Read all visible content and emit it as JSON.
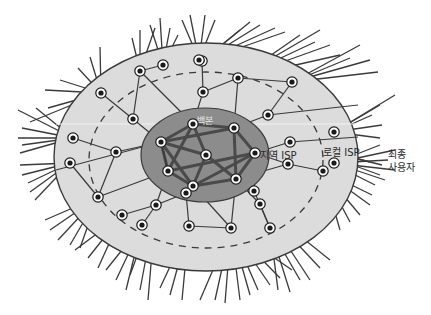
{
  "diagram": {
    "type": "internet-hierarchy",
    "labels": {
      "backbone": "백본",
      "regional_isp": "지역 ISP",
      "local_isp": "로컬 ISP",
      "end_user_line1": "최종",
      "end_user_line2": "사용자"
    },
    "colors": {
      "outer_region": "#dcdcdc",
      "core_region": "#8c8c8c",
      "line": "#3a3a3a",
      "backbone_link": "#4a4a4a",
      "node_fill": "#ffffff",
      "node_dot": "#1a1a1a"
    },
    "regions": {
      "outer": {
        "cx": 206,
        "cy": 157,
        "rx": 152,
        "ry": 114
      },
      "boundary_dashed": {
        "cx": 206,
        "cy": 160,
        "rx": 115,
        "ry": 87
      },
      "core": {
        "cx": 206,
        "cy": 155,
        "rx": 62,
        "ry": 45
      }
    },
    "backbone_nodes": [
      [
        161,
        142
      ],
      [
        193,
        124
      ],
      [
        234,
        128
      ],
      [
        255,
        153
      ],
      [
        206,
        155
      ],
      [
        168,
        171
      ],
      [
        193,
        186
      ],
      [
        236,
        179
      ]
    ],
    "backbone_links": [
      [
        0,
        1
      ],
      [
        1,
        2
      ],
      [
        2,
        3
      ],
      [
        3,
        7
      ],
      [
        7,
        6
      ],
      [
        6,
        5
      ],
      [
        5,
        0
      ],
      [
        0,
        4
      ],
      [
        1,
        4
      ],
      [
        4,
        7
      ],
      [
        4,
        6
      ],
      [
        0,
        6
      ],
      [
        1,
        5
      ],
      [
        2,
        7
      ],
      [
        3,
        6
      ],
      [
        5,
        3
      ],
      [
        0,
        2
      ]
    ],
    "regional_nodes": [
      [
        133,
        119
      ],
      [
        101,
        93
      ],
      [
        163,
        65
      ],
      [
        140,
        71
      ],
      [
        202,
        61
      ],
      [
        238,
        78
      ],
      [
        203,
        92
      ],
      [
        268,
        115
      ],
      [
        290,
        142
      ],
      [
        292,
        82
      ],
      [
        116,
        152
      ],
      [
        73,
        138
      ],
      [
        70,
        163
      ],
      [
        98,
        197
      ],
      [
        156,
        205
      ],
      [
        186,
        193
      ],
      [
        122,
        215
      ],
      [
        142,
        225
      ],
      [
        189,
        226
      ],
      [
        260,
        204
      ],
      [
        270,
        228
      ],
      [
        231,
        228
      ],
      [
        323,
        171
      ],
      [
        288,
        164
      ],
      [
        254,
        191
      ]
    ]
  }
}
